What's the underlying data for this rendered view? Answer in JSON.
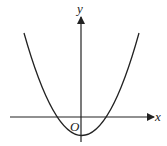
{
  "diagram": {
    "type": "function-graph",
    "labels": {
      "x_axis": "x",
      "y_axis": "y",
      "origin": "O"
    },
    "colors": {
      "stroke": "#222222",
      "background": "#ffffff"
    }
  }
}
